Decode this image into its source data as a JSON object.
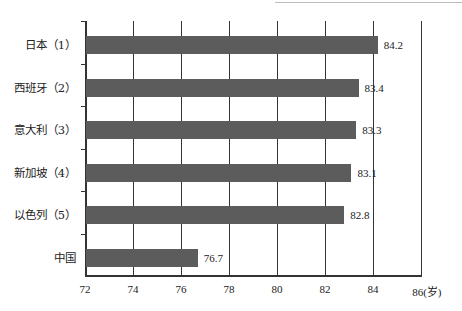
{
  "chart_data": {
    "type": "bar",
    "orientation": "horizontal",
    "title": "",
    "xlabel": "岁",
    "ylabel": "",
    "xlim": [
      72,
      86
    ],
    "xticks": [
      72,
      74,
      76,
      78,
      80,
      82,
      84,
      86
    ],
    "xtick_labels": [
      "72",
      "74",
      "76",
      "78",
      "80",
      "82",
      "84",
      "86"
    ],
    "x_unit_label": "(岁)",
    "grid": true,
    "legend": null,
    "categories": [
      "日本（1）",
      "西班牙（2）",
      "意大利（3）",
      "新加坡（4）",
      "以色列（5）",
      "中国"
    ],
    "values": [
      84.2,
      83.4,
      83.3,
      83.1,
      82.8,
      76.7
    ],
    "value_labels": [
      "84.2",
      "83.4",
      "83.3",
      "83.1",
      "82.8",
      "76.7"
    ],
    "bar_color": "#5c5c5c"
  }
}
